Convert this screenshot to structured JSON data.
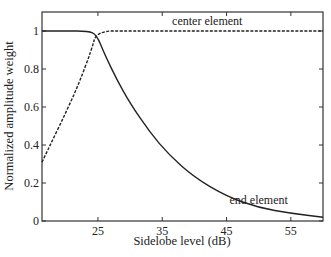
{
  "chart_data": {
    "type": "line",
    "title": "",
    "xlabel": "Sidelobe level (dB)",
    "ylabel": "Normalized amplitude weight",
    "xlim": [
      16.3,
      60
    ],
    "ylim": [
      0,
      1.1
    ],
    "xticks": [
      25,
      35,
      45,
      55
    ],
    "yticks": [
      0,
      0.2,
      0.4,
      0.6,
      0.8,
      1
    ],
    "ytick_labels": [
      "0",
      "0.2",
      "0.4",
      "0.6",
      "0.8",
      "1"
    ],
    "grid": false,
    "legend": "none (inline annotations)",
    "series": [
      {
        "name": "center element",
        "style": "dashed",
        "x": [
          16.3,
          18,
          20,
          22,
          24,
          24.8,
          30,
          40,
          50,
          60
        ],
        "y": [
          0.31,
          0.43,
          0.57,
          0.72,
          0.9,
          1.0,
          1.0,
          1.0,
          1.0,
          1.0
        ]
      },
      {
        "name": "end element",
        "style": "solid",
        "x": [
          16.3,
          20,
          23.5,
          24.8,
          26,
          28,
          30,
          33,
          36,
          40,
          45,
          50,
          55,
          60
        ],
        "y": [
          1.0,
          1.0,
          1.0,
          0.98,
          0.88,
          0.74,
          0.62,
          0.47,
          0.35,
          0.23,
          0.13,
          0.07,
          0.04,
          0.02
        ]
      }
    ],
    "annotations": [
      {
        "text": "center element",
        "x": 42,
        "y": 1.04
      },
      {
        "text": "end element",
        "x": 50,
        "y": 0.1
      }
    ]
  }
}
